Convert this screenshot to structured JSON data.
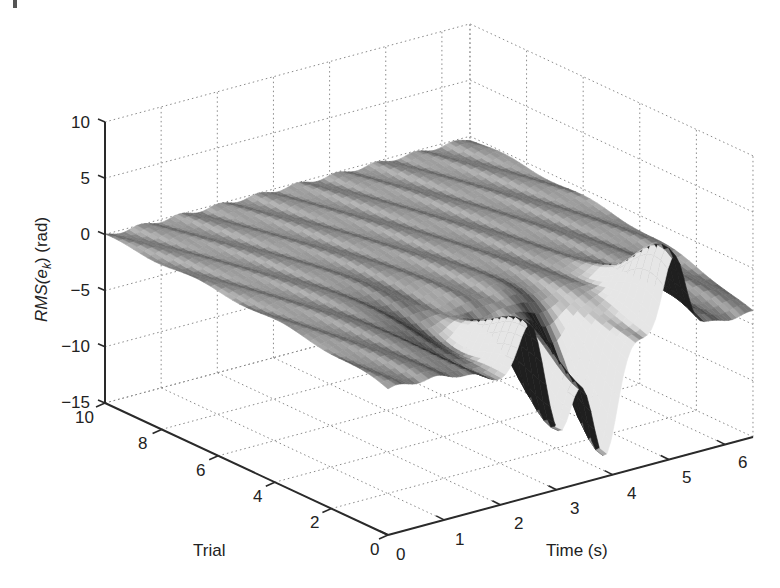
{
  "chart_data": {
    "type": "surface3d",
    "title": "",
    "xlabel": "Time (s)",
    "ylabel": "Trial",
    "zlabel": "RMS(e_k) (rad)",
    "zlabel_parts": {
      "prefix": "RMS(e",
      "subscript": "k",
      "suffix": ") (rad)"
    },
    "xlim": [
      0,
      6.5
    ],
    "ylim": [
      0,
      10
    ],
    "zlim": [
      -15,
      10
    ],
    "x_ticks": [
      0,
      1,
      2,
      3,
      4,
      5,
      6
    ],
    "y_ticks": [
      0,
      2,
      4,
      6,
      8,
      10
    ],
    "z_ticks": [
      10,
      5,
      0,
      -5,
      -10,
      -15
    ],
    "grid": true,
    "colormap": "gray",
    "baseline_far_trials": 0,
    "features": [
      {
        "kind": "peak",
        "time": 2.55,
        "trial": 0.3,
        "z": 2.0
      },
      {
        "kind": "trough",
        "time": 3.05,
        "trial": 0.2,
        "z": -10.5
      },
      {
        "kind": "trough",
        "time": 3.85,
        "trial": 0.1,
        "z": -13.5
      },
      {
        "kind": "peak",
        "time": 5.1,
        "trial": 0.3,
        "z": 4.0
      },
      {
        "kind": "shelf",
        "time": 2.2,
        "trial": 1.5,
        "z": -5.5
      }
    ],
    "near_trial_drift": -4.0
  },
  "axes": {
    "z_tick_labels": [
      "10",
      "5",
      "0",
      "−5",
      "−10",
      "−15"
    ],
    "y_tick_labels": [
      "0",
      "2",
      "4",
      "6",
      "8",
      "10"
    ],
    "x_tick_labels": [
      "0",
      "1",
      "2",
      "3",
      "4",
      "5",
      "6"
    ],
    "xlabel": "Time (s)",
    "ylabel": "Trial",
    "zlabel_prefix": "RMS(e",
    "zlabel_sub": "k",
    "zlabel_suffix": ") (rad)"
  },
  "colors": {
    "surface_base": "#8c8c8c",
    "surface_light": "#d9d9d9",
    "surface_dark": "#2e2e2e",
    "grid": "#8a8a8a",
    "axis": "#2a2a2a"
  }
}
